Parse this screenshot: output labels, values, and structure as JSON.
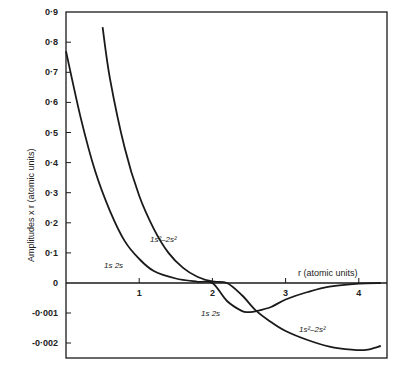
{
  "chart_data": {
    "type": "line",
    "title": "",
    "xlabel": "r (atomic units)",
    "ylabel": "Amplitudes x r (atomic units)",
    "xlim": [
      0,
      4.3
    ],
    "ylim_upper": [
      0,
      0.9
    ],
    "ylim_lower": [
      -0.0025,
      0
    ],
    "x_ticks": [
      "1",
      "2",
      "3",
      "4"
    ],
    "y_ticks_upper": [
      "0·9",
      "0·8",
      "0·7",
      "0·6",
      "0·5",
      "0·4",
      "0·3",
      "0·2",
      "0·1",
      "0"
    ],
    "y_ticks_lower": [
      "-0·001",
      "-0·002"
    ],
    "grid": false,
    "legend": "none (curves labelled inline)",
    "note": "Upper part (y>0) plotted on scale 0–0.9; lower part (y<0) on expanded scale 0 to -0.0025",
    "series": [
      {
        "name": "1s 2s",
        "x": [
          0.0,
          0.2,
          0.4,
          0.6,
          0.8,
          1.0,
          1.2,
          1.5,
          1.8,
          2.0,
          2.2,
          2.4,
          2.5,
          2.6,
          2.8,
          3.0,
          3.3,
          3.6,
          4.0,
          4.3
        ],
        "y": [
          0.77,
          0.55,
          0.37,
          0.24,
          0.14,
          0.08,
          0.04,
          0.015,
          0.004,
          0.0,
          -0.0006,
          -0.00093,
          -0.00097,
          -0.00094,
          -0.0008,
          -0.00055,
          -0.0003,
          -0.00012,
          -2e-05,
          0.0
        ]
      },
      {
        "name": "1s²-2s²",
        "x": [
          0.5,
          0.6,
          0.8,
          1.0,
          1.2,
          1.4,
          1.6,
          1.8,
          2.0,
          2.2,
          2.4,
          2.6,
          2.8,
          3.0,
          3.3,
          3.6,
          3.9,
          4.1,
          4.3
        ],
        "y": [
          0.85,
          0.68,
          0.45,
          0.29,
          0.18,
          0.1,
          0.05,
          0.02,
          0.005,
          0.0,
          -0.0004,
          -0.00093,
          -0.0013,
          -0.0016,
          -0.0019,
          -0.00212,
          -0.00222,
          -0.00223,
          -0.0021
        ]
      }
    ]
  },
  "labels": {
    "y_axis_title": "Amplitudes x r (atomic units)",
    "x_axis_title": "r (atomic units)",
    "curve_1s2s_upper": "1s 2s",
    "curve_1s2s2_upper": "1s²–2s²",
    "curve_1s2s_lower": "1s 2s",
    "curve_1s2s2_lower": "1s²–2s²"
  },
  "colors": {
    "line": "#1a1a1a",
    "background": "#ffffff"
  }
}
